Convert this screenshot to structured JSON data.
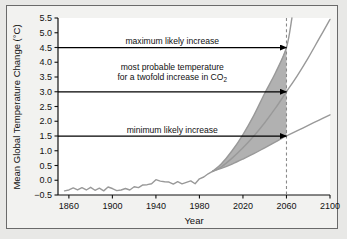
{
  "figure": {
    "background_color": "#e8e8e6",
    "panel_color": "#f2f2f0",
    "frame_color": "#6a6a6a"
  },
  "chart_data": {
    "type": "line",
    "title": "",
    "xlabel": "Year",
    "ylabel": "Mean Global Temperature Change (°C)",
    "xlim": [
      1850,
      2100
    ],
    "ylim": [
      -0.5,
      5.5
    ],
    "xticks": [
      1860,
      1900,
      1940,
      1980,
      2020,
      2060,
      2100
    ],
    "xtick_labels": [
      "1860",
      "1900",
      "1940",
      "1980",
      "2020",
      "2060",
      "2100"
    ],
    "yticks": [
      -0.5,
      0.0,
      0.5,
      1.0,
      1.5,
      2.0,
      2.5,
      3.0,
      3.5,
      4.0,
      4.5,
      5.0,
      5.5
    ],
    "ytick_labels": [
      "−0.5",
      "0.0",
      "0.5",
      "1.0",
      "1.5",
      "2.0",
      "2.5",
      "3.0",
      "3.5",
      "4.0",
      "4.5",
      "5.0",
      "5.5"
    ],
    "grid": false,
    "legend": "none",
    "line_color": "#999999",
    "band_fill_color": "#adadad",
    "arrow_color": "#000000",
    "reference_line": {
      "x": 2060,
      "style": "dashed",
      "color": "#8a8a8a",
      "label": "2060"
    },
    "series": [
      {
        "name": "observed-record",
        "kind": "historical",
        "x": [
          1856,
          1860,
          1864,
          1868,
          1872,
          1876,
          1880,
          1884,
          1888,
          1892,
          1896,
          1900,
          1904,
          1908,
          1912,
          1916,
          1920,
          1924,
          1928,
          1932,
          1936,
          1940,
          1944,
          1948,
          1952,
          1956,
          1960,
          1964,
          1968,
          1972,
          1976,
          1980,
          1984,
          1988,
          1992
        ],
        "values": [
          -0.36,
          -0.33,
          -0.26,
          -0.33,
          -0.25,
          -0.33,
          -0.24,
          -0.34,
          -0.27,
          -0.36,
          -0.23,
          -0.28,
          -0.35,
          -0.33,
          -0.28,
          -0.33,
          -0.22,
          -0.25,
          -0.16,
          -0.15,
          -0.12,
          0.02,
          -0.03,
          -0.05,
          -0.06,
          -0.13,
          -0.05,
          -0.12,
          -0.07,
          -0.02,
          -0.12,
          0.05,
          0.11,
          0.22,
          0.3
        ]
      },
      {
        "name": "maximum-likely-increase",
        "kind": "projection",
        "x": [
          1992,
          2000,
          2010,
          2020,
          2030,
          2040,
          2050,
          2060,
          2065
        ],
        "values": [
          0.3,
          0.55,
          1.0,
          1.55,
          2.2,
          2.95,
          3.65,
          4.5,
          5.5
        ],
        "value_at_2060": 4.5
      },
      {
        "name": "most-probable-increase",
        "kind": "projection",
        "x": [
          1992,
          2000,
          2010,
          2020,
          2030,
          2040,
          2050,
          2060,
          2070,
          2080,
          2090,
          2100
        ],
        "values": [
          0.3,
          0.45,
          0.75,
          1.1,
          1.5,
          1.95,
          2.45,
          3.0,
          3.55,
          4.15,
          4.8,
          5.45
        ],
        "value_at_2060": 3.0
      },
      {
        "name": "minimum-likely-increase",
        "kind": "projection",
        "x": [
          1992,
          2000,
          2010,
          2020,
          2030,
          2040,
          2050,
          2060,
          2070,
          2080,
          2090,
          2100
        ],
        "values": [
          0.3,
          0.4,
          0.55,
          0.72,
          0.9,
          1.1,
          1.3,
          1.5,
          1.68,
          1.86,
          2.04,
          2.22
        ],
        "value_at_2060": 2.2
      }
    ],
    "shaded_band": {
      "name": "likely-range-band",
      "between": [
        "maximum-likely-increase",
        "minimum-likely-increase"
      ],
      "x_start": 1992,
      "x_end": 2060
    },
    "annotations": [
      {
        "id": "maximum",
        "label": "maximum likely increase",
        "y": 4.5,
        "arrow_from_x": 1850,
        "arrow_to_x": 2060
      },
      {
        "id": "most-probable-line1",
        "label": "most probable temperature",
        "y": 3.75,
        "arrow": false
      },
      {
        "id": "most-probable-line2",
        "label_prefix": "for a twofold increase in CO",
        "label_subscript": "2",
        "y": 3.4,
        "arrow": false
      },
      {
        "id": "most-probable",
        "label": "",
        "y": 3.0,
        "arrow_from_x": 1850,
        "arrow_to_x": 2060
      },
      {
        "id": "minimum",
        "label": "minimum likely increase",
        "y": 1.5,
        "arrow_from_x": 1850,
        "arrow_to_x": 2060
      }
    ]
  }
}
